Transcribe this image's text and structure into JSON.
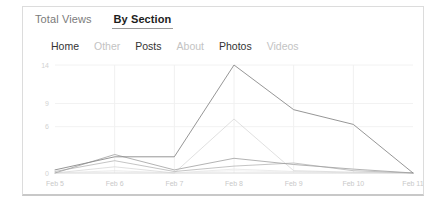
{
  "card": {
    "tabs": [
      {
        "label": "Total Views",
        "active": false
      },
      {
        "label": "By Section",
        "active": true
      }
    ],
    "sections": [
      {
        "label": "Home",
        "active": true,
        "color": "#9a9a9a"
      },
      {
        "label": "Other",
        "active": false,
        "color": "#cccccc"
      },
      {
        "label": "Posts",
        "active": true,
        "color": "#8c8c8c"
      },
      {
        "label": "About",
        "active": false,
        "color": "#dddddd"
      },
      {
        "label": "Photos",
        "active": true,
        "color": "#7a7a7a"
      },
      {
        "label": "Videos",
        "active": false,
        "color": "#e0e0e0"
      }
    ]
  },
  "chart_data": {
    "type": "line",
    "title": "",
    "xlabel": "",
    "ylabel": "",
    "x": [
      "Feb 5",
      "Feb 6",
      "Feb 7",
      "Feb 8",
      "Feb 9",
      "Feb 10",
      "Feb 11"
    ],
    "yticks": [
      0,
      6,
      9,
      14
    ],
    "ylim": [
      0,
      14
    ],
    "grid": true,
    "legend_position": "top",
    "series": [
      {
        "name": "Photos",
        "color": "#8a8a8a",
        "width": 0.9,
        "values": [
          0.4,
          2.1,
          2.1,
          14.0,
          8.2,
          6.3,
          0.0
        ]
      },
      {
        "name": "Home",
        "color": "#9f9f9f",
        "width": 0.8,
        "values": [
          0.0,
          2.4,
          0.4,
          1.9,
          1.1,
          0.5,
          0.0
        ]
      },
      {
        "name": "Posts",
        "color": "#b5b5b5",
        "width": 0.8,
        "values": [
          0.2,
          1.6,
          0.2,
          0.9,
          1.3,
          0.3,
          0.0
        ]
      },
      {
        "name": "Other",
        "color": "#d2d2d2",
        "width": 0.7,
        "values": [
          0.0,
          0.8,
          0.0,
          7.0,
          0.3,
          0.1,
          0.0
        ]
      },
      {
        "name": "About",
        "color": "#e2e2e2",
        "width": 0.7,
        "values": [
          0.0,
          0.3,
          0.0,
          0.5,
          0.2,
          0.0,
          0.0
        ]
      },
      {
        "name": "Videos",
        "color": "#ebebeb",
        "width": 0.7,
        "values": [
          0.0,
          0.1,
          0.0,
          0.3,
          0.1,
          0.0,
          0.0
        ]
      }
    ]
  }
}
